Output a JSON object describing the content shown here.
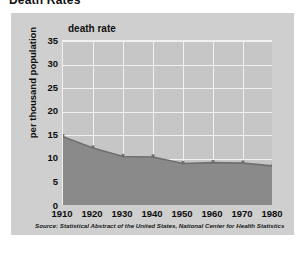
{
  "page": {
    "title": "Death Rates"
  },
  "figure": {
    "chart_title": "death rate",
    "y_axis_title": "per thousand population",
    "source_note": "Source: Statistical Abstract of the United States, National Center for Health Statistics",
    "colors": {
      "page_background": "#ffffff",
      "panel_background": "#cfcfcf",
      "plot_background": "#c6c6c6",
      "gridline": "#f2f2f2",
      "area_fill": "#8a8a8a",
      "area_line": "#6f6f6f",
      "text": "#101010"
    }
  },
  "chart_data": {
    "type": "area",
    "title": "death rate",
    "xlabel": "",
    "ylabel": "per thousand population",
    "x": [
      1910,
      1920,
      1930,
      1940,
      1950,
      1960,
      1970,
      1980
    ],
    "categories": [
      "1910",
      "1920",
      "1930",
      "1940",
      "1950",
      "1960",
      "1970",
      "1980"
    ],
    "values": [
      14.7,
      12.3,
      10.5,
      10.4,
      9.0,
      9.2,
      9.1,
      8.5
    ],
    "yticks": [
      0,
      5,
      10,
      15,
      20,
      25,
      30,
      35
    ],
    "ytick_labels": [
      "0",
      "5",
      "10",
      "15",
      "20",
      "25",
      "30",
      "35"
    ],
    "xtick_labels": [
      "1910",
      "1920",
      "1930",
      "1940",
      "1950",
      "1960",
      "1970",
      "1980"
    ],
    "xlim": [
      1910,
      1980
    ],
    "ylim": [
      0,
      35
    ],
    "grid": true,
    "legend": false,
    "annotation": "Source: Statistical Abstract of the United States, National Center for Health Statistics"
  }
}
